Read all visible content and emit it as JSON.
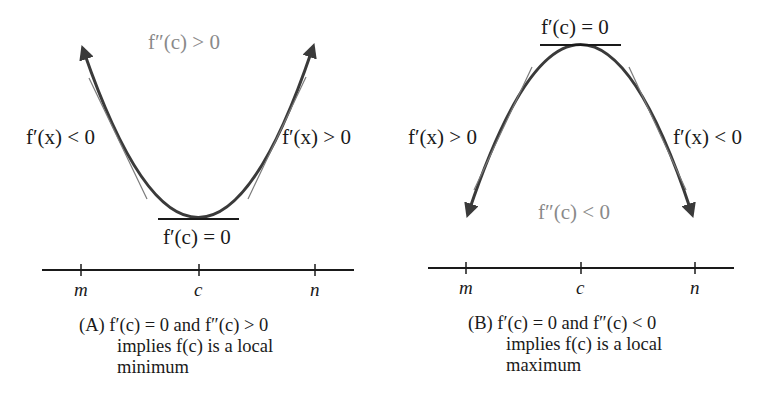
{
  "panels": [
    {
      "id": "A",
      "top_label": "f″(c) > 0",
      "left_label": "f′(x) < 0",
      "right_label": "f′(x) > 0",
      "vertex_label": "f′(c) = 0",
      "ticks": [
        "m",
        "c",
        "n"
      ],
      "caption_line1": "(A)  f′(c) = 0 and f″(c) > 0",
      "caption_line2": "implies f(c) is a local",
      "caption_line3": "minimum"
    },
    {
      "id": "B",
      "top_label": "f′(c) = 0",
      "left_label": "f′(x) > 0",
      "right_label": "f′(x) < 0",
      "bottom_label": "f″(c) < 0",
      "ticks": [
        "m",
        "c",
        "n"
      ],
      "caption_line1": "(B)  f′(c) = 0 and f″(c) < 0",
      "caption_line2": "implies f(c) is a local",
      "caption_line3": "maximum"
    }
  ],
  "colors": {
    "curve": "#3a3a3a",
    "tangent": "#777777",
    "gray_text": "#8a8a8a"
  }
}
